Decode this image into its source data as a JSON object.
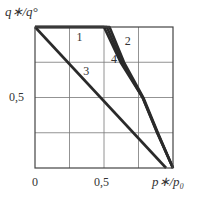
{
  "chart_data": {
    "type": "line",
    "title": "",
    "xlabel": "p∗/p₀",
    "ylabel": "q∗/q°",
    "xlim": [
      0,
      1
    ],
    "ylim": [
      0,
      1
    ],
    "grid": true,
    "grid_step": 0.25,
    "x_tick_labels": [
      "0",
      "0,5"
    ],
    "y_tick_labels": [
      "0,5"
    ],
    "series": [
      {
        "name": "1",
        "x": [
          0,
          0.5,
          0.62,
          0.78,
          0.885,
          1.0
        ],
        "y": [
          1,
          1,
          0.75,
          0.5,
          0.25,
          0
        ]
      },
      {
        "name": "2",
        "x": [
          0,
          0.54,
          0.645,
          0.785,
          0.89,
          1.0
        ],
        "y": [
          1,
          1,
          0.75,
          0.5,
          0.25,
          0
        ]
      },
      {
        "name": "3",
        "x": [
          0,
          0.95
        ],
        "y": [
          1,
          0
        ]
      },
      {
        "name": "4",
        "x": [
          0,
          0.52,
          0.632,
          0.78,
          0.887,
          1.0
        ],
        "y": [
          1,
          1,
          0.75,
          0.5,
          0.25,
          0
        ]
      }
    ],
    "curve_labels": [
      {
        "text": "1",
        "x": 0.3,
        "y": 0.93
      },
      {
        "text": "2",
        "x": 0.65,
        "y": 0.9
      },
      {
        "text": "3",
        "x": 0.35,
        "y": 0.69
      },
      {
        "text": "4",
        "x": 0.55,
        "y": 0.77
      }
    ]
  },
  "labels": {
    "ylabel": "q∗/q°",
    "xlabel": "p∗/p₀",
    "x_tick_0": "0",
    "x_tick_half": "0,5",
    "y_tick_half": "0,5"
  }
}
